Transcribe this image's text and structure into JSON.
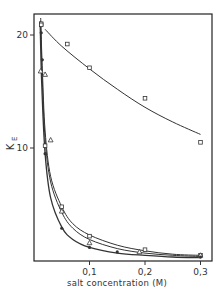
{
  "chart_data": {
    "type": "scatter",
    "title": "",
    "xlabel": "salt concentration (M)",
    "ylabel": "K_E",
    "ylabel_main": "K",
    "ylabel_sub": "E",
    "xlim": [
      0,
      0.33
    ],
    "ylim": [
      0,
      21.5
    ],
    "xticks": [
      0.1,
      0.2,
      0.3
    ],
    "xtick_labels": [
      "0,1",
      "0,2",
      "0,3"
    ],
    "yticks": [
      10,
      20
    ],
    "ytick_labels": [
      "10",
      "20"
    ],
    "grid": false,
    "legend": null,
    "series": [
      {
        "name": "open squares (slow decay)",
        "marker": "open-square",
        "points": [
          [
            0.013,
            21.0
          ],
          [
            0.06,
            19.2
          ],
          [
            0.1,
            17.1
          ],
          [
            0.2,
            14.4
          ],
          [
            0.3,
            10.5
          ]
        ],
        "curve": [
          [
            0.02,
            20.5
          ],
          [
            0.05,
            19.0
          ],
          [
            0.1,
            17.0
          ],
          [
            0.15,
            15.2
          ],
          [
            0.2,
            13.6
          ],
          [
            0.25,
            12.3
          ],
          [
            0.3,
            11.2
          ]
        ]
      },
      {
        "name": "open squares (fast decay)",
        "marker": "open-square",
        "points": [
          [
            0.013,
            20.9
          ],
          [
            0.02,
            10.2
          ],
          [
            0.05,
            4.8
          ],
          [
            0.1,
            2.2
          ],
          [
            0.2,
            1.0
          ],
          [
            0.3,
            0.5
          ]
        ],
        "curve": [
          [
            0.012,
            21.5
          ],
          [
            0.015,
            17.0
          ],
          [
            0.02,
            11.5
          ],
          [
            0.03,
            7.5
          ],
          [
            0.05,
            4.8
          ],
          [
            0.07,
            3.3
          ],
          [
            0.1,
            2.3
          ],
          [
            0.15,
            1.4
          ],
          [
            0.2,
            0.9
          ],
          [
            0.25,
            0.6
          ],
          [
            0.3,
            0.5
          ]
        ]
      },
      {
        "name": "open triangles",
        "marker": "open-triangle",
        "points": [
          [
            0.012,
            16.8
          ],
          [
            0.02,
            16.5
          ],
          [
            0.03,
            10.7
          ],
          [
            0.05,
            4.4
          ],
          [
            0.1,
            1.6
          ],
          [
            0.19,
            0.8
          ],
          [
            0.3,
            0.5
          ]
        ],
        "curve": [
          [
            0.012,
            21.2
          ],
          [
            0.015,
            16.0
          ],
          [
            0.02,
            10.8
          ],
          [
            0.03,
            7.0
          ],
          [
            0.05,
            4.3
          ],
          [
            0.07,
            2.9
          ],
          [
            0.1,
            1.9
          ],
          [
            0.15,
            1.1
          ],
          [
            0.2,
            0.7
          ],
          [
            0.25,
            0.5
          ],
          [
            0.3,
            0.4
          ]
        ]
      },
      {
        "name": "filled circles",
        "marker": "filled-circle",
        "points": [
          [
            0.013,
            20.2
          ],
          [
            0.015,
            17.8
          ],
          [
            0.02,
            9.5
          ],
          [
            0.05,
            2.9
          ],
          [
            0.1,
            1.2
          ],
          [
            0.15,
            0.8
          ],
          [
            0.3,
            0.35
          ]
        ],
        "curve": [
          [
            0.011,
            21.2
          ],
          [
            0.014,
            15.5
          ],
          [
            0.02,
            9.5
          ],
          [
            0.03,
            5.6
          ],
          [
            0.05,
            3.0
          ],
          [
            0.07,
            1.9
          ],
          [
            0.1,
            1.2
          ],
          [
            0.15,
            0.7
          ],
          [
            0.2,
            0.5
          ],
          [
            0.25,
            0.35
          ],
          [
            0.3,
            0.3
          ]
        ]
      }
    ],
    "colors": {
      "line": "#333333",
      "axis": "#222222",
      "background": "#ffffff"
    }
  }
}
